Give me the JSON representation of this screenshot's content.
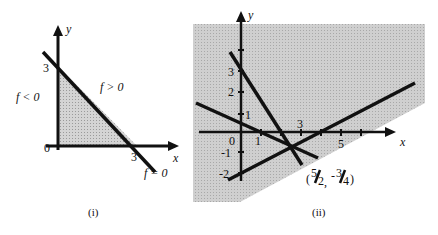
{
  "figure_i": {
    "caption": "(i)",
    "axis_x_label": "x",
    "axis_y_label": "y",
    "origin_label": "0",
    "y_intercept_label": "3",
    "x_intercept_label": "3",
    "region_negative_label": "f < 0",
    "region_positive_label": "f > 0",
    "line_label": "f = 0",
    "colors": {
      "shade": "#c8c8c8",
      "line": "#111111"
    }
  },
  "figure_ii": {
    "caption": "(ii)",
    "axis_x_label": "x",
    "axis_y_label": "y",
    "origin_label": "0",
    "x_tick_labels": [
      "1",
      "3",
      "5"
    ],
    "y_tick_labels": [
      "1",
      "2",
      "3",
      "-1",
      "-2"
    ],
    "intersection_label": "(5/2, -3/4)",
    "intersection_num1": "5",
    "intersection_den1": "2",
    "intersection_num2": "3",
    "intersection_den2": "4",
    "colors": {
      "shade": "#c4c4c4",
      "line": "#111111"
    }
  }
}
